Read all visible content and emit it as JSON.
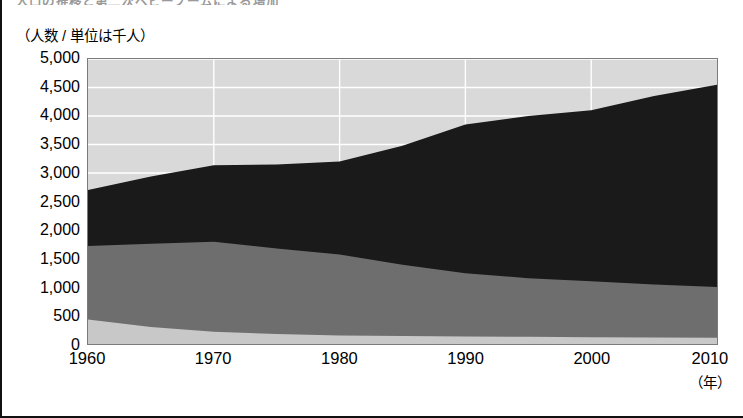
{
  "figure": {
    "clipped_heading": "人口の推移と第二次ベビーブームによる増加",
    "y_axis_unit_label": "（人数 / 単位は千人）",
    "x_axis_unit_label": "（年）"
  },
  "chart_data": {
    "type": "area",
    "title": "",
    "xlabel": "（年）",
    "ylabel": "（人数 / 単位は千人）",
    "x": [
      1960,
      1965,
      1970,
      1975,
      1980,
      1985,
      1990,
      1995,
      2000,
      2005,
      2010
    ],
    "xlim": [
      1960,
      2010
    ],
    "ylim": [
      0,
      5000
    ],
    "ytick_labels": [
      "0",
      "500",
      "1,000",
      "1,500",
      "2,000",
      "2,500",
      "3,000",
      "3,500",
      "4,000",
      "4,500",
      "5,000"
    ],
    "ytick_values": [
      0,
      500,
      1000,
      1500,
      2000,
      2500,
      3000,
      3500,
      4000,
      4500,
      5000
    ],
    "xtick_labels": [
      "1960",
      "1970",
      "1980",
      "1990",
      "2000",
      "2010"
    ],
    "xtick_values": [
      1960,
      1970,
      1980,
      1990,
      2000,
      2010
    ],
    "grid": true,
    "grid_color": "#ffffff",
    "plot_background": "#d9d9d9",
    "stacked": true,
    "legend_position": "none",
    "series": [
      {
        "name": "layer-1-bottom",
        "color": "#c8c8c8",
        "values": [
          430,
          300,
          215,
          175,
          150,
          140,
          130,
          125,
          120,
          115,
          110
        ]
      },
      {
        "name": "layer-2-midgray",
        "color": "#6e6e6e",
        "values": [
          1290,
          1460,
          1580,
          1500,
          1420,
          1250,
          1110,
          1030,
          980,
          930,
          890
        ]
      },
      {
        "name": "layer-3-black",
        "color": "#1a1a1a",
        "values": [
          980,
          1180,
          1340,
          1475,
          1630,
          2090,
          2610,
          2845,
          3000,
          3305,
          3550
        ]
      }
    ],
    "totals": [
      2700,
      2940,
      3135,
      3150,
      3200,
      3480,
      3850,
      4000,
      4100,
      4350,
      4550
    ]
  }
}
